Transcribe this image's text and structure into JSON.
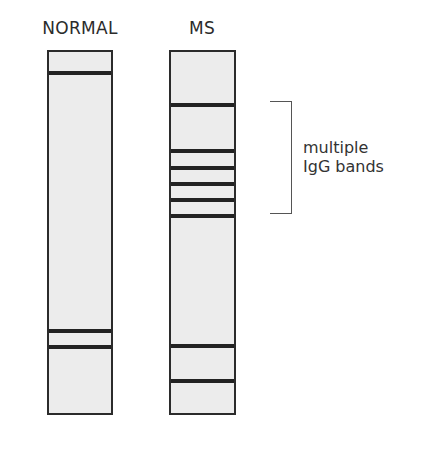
{
  "lanes": [
    {
      "label": "NORMAL",
      "bands_y": [
        71,
        329,
        345
      ]
    },
    {
      "label": "MS",
      "bands_y": [
        103,
        149,
        166,
        182,
        198,
        214,
        344,
        379
      ]
    }
  ],
  "annotation": {
    "line1": "multiple",
    "line2": "IgG bands"
  },
  "colors": {
    "strip_fill": "#ececec",
    "band": "#222222",
    "outline": "#2b2b2b"
  }
}
